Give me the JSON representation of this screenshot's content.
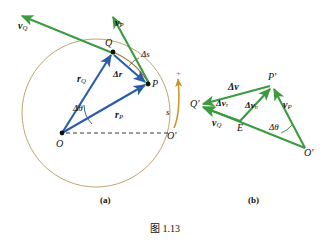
{
  "figure": {
    "caption": "图 1.13",
    "panels": [
      {
        "key": "a",
        "label": "(a)"
      },
      {
        "key": "b",
        "label": "(b)"
      }
    ]
  },
  "colors": {
    "vector_blue": "#2b5ca8",
    "vector_green": "#3d9a40",
    "circle_tan": "#b59a5e",
    "arc_gold": "#c8942a",
    "plus_red": "#c86a6a",
    "dashed_black": "#222222",
    "text_black": "#111111",
    "background": "#ffffff"
  },
  "panel_a": {
    "points": [
      {
        "name": "O",
        "label": "O",
        "x": 62,
        "y": 133
      },
      {
        "name": "Op",
        "label": "O'",
        "x": 170,
        "y": 133
      },
      {
        "name": "Q",
        "label": "Q",
        "x": 113,
        "y": 52
      },
      {
        "name": "P",
        "label": "P",
        "x": 148,
        "y": 83
      }
    ],
    "circle": {
      "cx": 96,
      "cy": 113,
      "r": 74
    },
    "vectors": [
      {
        "name": "r_Q",
        "label": "r",
        "sub": "Q",
        "color": "blue",
        "from": "O",
        "to": "Q"
      },
      {
        "name": "r_P",
        "label": "r",
        "sub": "P",
        "color": "blue",
        "from": "O",
        "to": "P"
      },
      {
        "name": "dr",
        "label": "Δr",
        "sub": "",
        "color": "blue",
        "from": "Q",
        "to": "P"
      },
      {
        "name": "v_Q",
        "label": "v",
        "sub": "Q",
        "color": "green",
        "from": "Q",
        "to": "upper-left"
      },
      {
        "name": "v_P",
        "label": "v",
        "sub": "P",
        "color": "green",
        "from": "P",
        "to": "upper-left"
      }
    ],
    "labels": {
      "r_Q": "r",
      "r_Q_sub": "Q",
      "r_P": "r",
      "r_P_sub": "P",
      "delta_r": "Δr",
      "delta_theta": "Δθ",
      "delta_s": "Δs",
      "v_Q": "v",
      "v_Q_sub": "Q",
      "v_P": "v",
      "v_P_sub": "P",
      "O": "O",
      "O_prime": "O'",
      "Q": "Q",
      "P": "P",
      "s": "s",
      "plus": "+"
    }
  },
  "panel_b": {
    "points": [
      {
        "name": "Op",
        "label": "O'",
        "x": 305,
        "y": 148
      },
      {
        "name": "Pp",
        "label": "P'",
        "x": 272,
        "y": 86
      },
      {
        "name": "Qp",
        "label": "Q'",
        "x": 199,
        "y": 106
      },
      {
        "name": "E",
        "label": "E",
        "x": 240,
        "y": 121
      }
    ],
    "vectors": [
      {
        "name": "v_P",
        "label": "v",
        "sub": "P",
        "color": "green",
        "from": "Op",
        "to": "Pp"
      },
      {
        "name": "v_Q",
        "label": "v",
        "sub": "Q",
        "color": "green",
        "from": "Op",
        "to": "Qp"
      },
      {
        "name": "dv",
        "label": "Δv",
        "sub": "",
        "color": "green",
        "from": "Pp",
        "to": "Qp"
      },
      {
        "name": "dv_n",
        "label": "Δv",
        "sub": "n",
        "color": "green",
        "from": "E",
        "to": "Pp"
      },
      {
        "name": "dv_t",
        "label": "Δv",
        "sub": "τ",
        "color": "green",
        "from": "E",
        "to": "Qp"
      }
    ],
    "labels": {
      "delta_v": "Δv",
      "delta_v_tau": "Δv",
      "delta_v_tau_sub": "τ",
      "delta_v_n": "Δv",
      "delta_v_n_sub": "n",
      "v_Q": "v",
      "v_Q_sub": "Q",
      "v_P": "v",
      "v_P_sub": "P",
      "delta_theta": "Δθ",
      "O_prime": "O'",
      "P_prime": "P'",
      "Q_prime": "Q'",
      "E": "E"
    }
  }
}
